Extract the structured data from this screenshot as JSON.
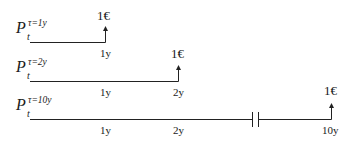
{
  "diagram": {
    "line_color": "#222222",
    "rows": [
      {
        "price": {
          "symbol": "P",
          "subscript": "t",
          "superscript": "τ=1y"
        },
        "ticks": [
          "1y"
        ],
        "payoff": "1€"
      },
      {
        "price": {
          "symbol": "P",
          "subscript": "t",
          "superscript": "τ=2y"
        },
        "ticks": [
          "1y",
          "2y"
        ],
        "payoff": "1€"
      },
      {
        "price": {
          "symbol": "P",
          "subscript": "t",
          "superscript": "τ=10y"
        },
        "ticks": [
          "1y",
          "2y",
          "10y"
        ],
        "payoff": "1€",
        "axis_break": true
      }
    ]
  }
}
